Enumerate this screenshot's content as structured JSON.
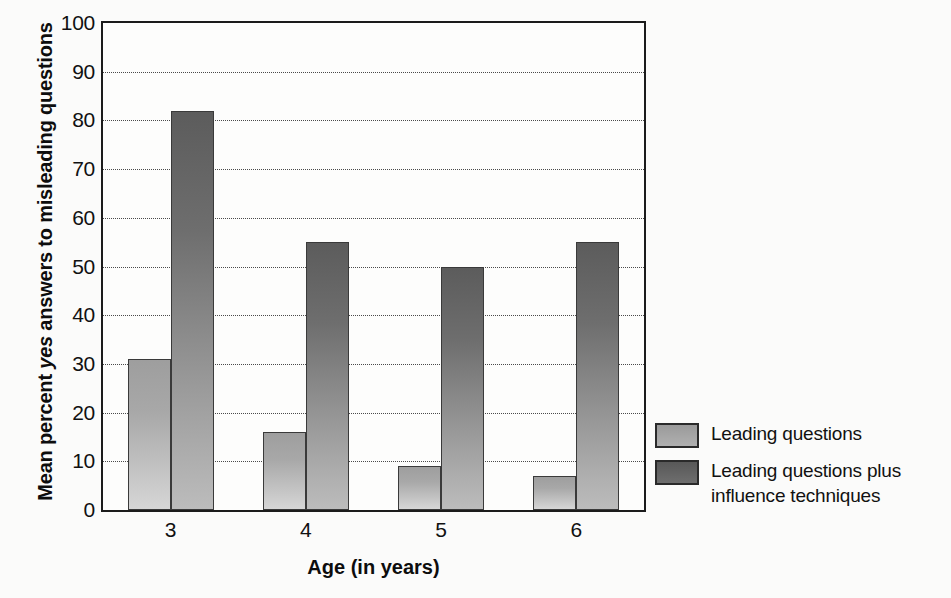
{
  "chart_data": {
    "type": "bar",
    "title": "",
    "xlabel": "Age (in years)",
    "ylabel": "Mean percent yes answers to misleading questions",
    "ylabel_parts": {
      "pre": "Mean percent ",
      "italic": "yes",
      "post": " answers to misleading questions"
    },
    "categories": [
      "3",
      "4",
      "5",
      "6"
    ],
    "ylim": [
      0,
      100
    ],
    "yticks": [
      0,
      10,
      20,
      30,
      40,
      50,
      60,
      70,
      80,
      90,
      100
    ],
    "ytick_labels": [
      "0",
      "10",
      "20",
      "30",
      "40",
      "50",
      "60",
      "70",
      "80",
      "90",
      "100"
    ],
    "grid": true,
    "grid_style": "dotted-horizontal",
    "legend_position": "right",
    "series": [
      {
        "name": "Leading questions",
        "color": "#a8a8a8",
        "values": [
          31,
          16,
          9,
          7
        ]
      },
      {
        "name": "Leading questions plus influence techniques",
        "color": "#6e6e6e",
        "values": [
          82,
          55,
          50,
          55
        ]
      }
    ]
  },
  "legend": {
    "entries": [
      {
        "label": "Leading questions",
        "swatch": "light"
      },
      {
        "label": "Leading questions plus influence techniques",
        "swatch": "dark"
      }
    ]
  },
  "colors": {
    "axis": "#1b1b1b",
    "grid": "#4a4a4a",
    "series_light": "#a8a8a8",
    "series_dark": "#6e6e6e",
    "background": "#fbfbfa"
  }
}
